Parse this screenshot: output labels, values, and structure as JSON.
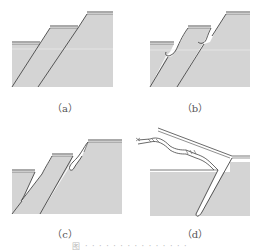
{
  "figure": {
    "panels": [
      {
        "id": "a",
        "label": "（a）",
        "description": "Layered slope with two inclined fault lines, intact"
      },
      {
        "id": "b",
        "label": "（b）",
        "description": "Notches forming at the top of each inclined layer"
      },
      {
        "id": "c",
        "label": "（c）",
        "description": "Crack opening along inclined layer and hooked lip at top"
      },
      {
        "id": "d",
        "label": "（d）",
        "description": "Layer bent and sliding out with braided rope-like segments"
      }
    ],
    "caption": "图 · · · · · · · · · · · · · · ·",
    "colors": {
      "fill": "#d4d4d4",
      "line": "#555555",
      "background": "#ffffff"
    }
  }
}
